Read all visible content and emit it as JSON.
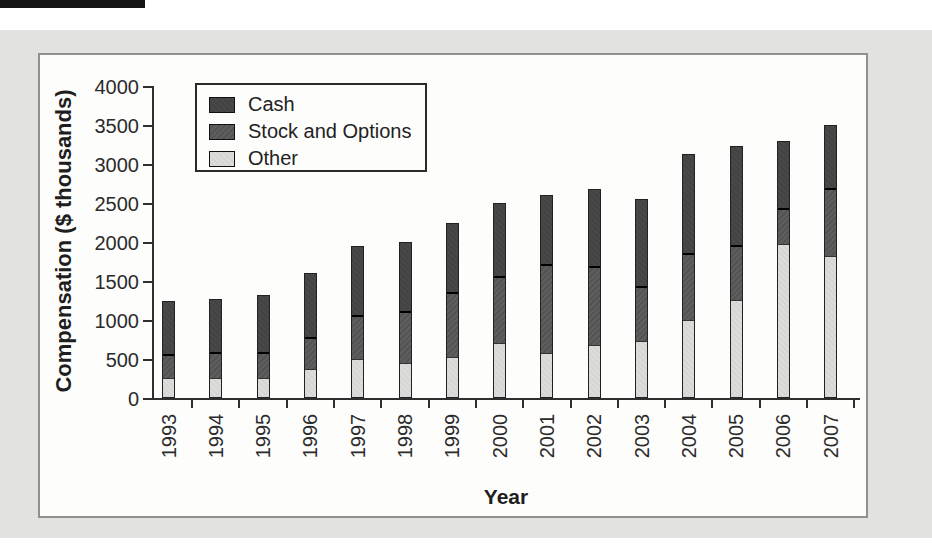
{
  "figure": {
    "kind": "printed textbook stacked bar chart",
    "colors": {
      "page_background": "#ffffff",
      "panel_background": "#e2e2df",
      "chart_background": "#fdfdfc",
      "frame_border": "#909090",
      "axis": "#2f2f2f",
      "bar_outline": "#222222",
      "segment_separator": "#000000"
    }
  },
  "chart_data": {
    "type": "bar",
    "stacked": true,
    "categories": [
      "1993",
      "1994",
      "1995",
      "1996",
      "1997",
      "1998",
      "1999",
      "2000",
      "2001",
      "2002",
      "2003",
      "2004",
      "2005",
      "2006",
      "2007"
    ],
    "series": [
      {
        "name": "Cash",
        "color": "#464646",
        "values": [
          700,
          700,
          750,
          825,
          900,
          900,
          900,
          950,
          900,
          1000,
          1125,
          1275,
          1275,
          875,
          825
        ]
      },
      {
        "name": "Stock and Options",
        "color": "#585858",
        "values": [
          300,
          325,
          325,
          400,
          550,
          650,
          825,
          850,
          1125,
          1000,
          700,
          850,
          700,
          450,
          850
        ]
      },
      {
        "name": "Other",
        "color": "#dbdbd9",
        "values": [
          250,
          250,
          250,
          375,
          500,
          450,
          525,
          700,
          575,
          675,
          725,
          1000,
          1250,
          1975,
          1825
        ]
      }
    ],
    "totals": [
      1250,
      1275,
      1325,
      1600,
      1950,
      2000,
      2250,
      2500,
      2600,
      2675,
      2550,
      3125,
      3225,
      3300,
      3500
    ],
    "stack_order_bottom_to_top": [
      "Other",
      "Stock and Options",
      "Cash"
    ],
    "xlabel": "Year",
    "ylabel": "Compensation ($ thousands)",
    "ylim": [
      0,
      4000
    ],
    "yticks": [
      "0",
      "500",
      "1000",
      "1500",
      "2000",
      "2500",
      "3000",
      "3500",
      "4000"
    ],
    "grid": "off",
    "legend_position": "upper left inside plot",
    "legend_entries": [
      "Cash",
      "Stock and Options",
      "Other"
    ]
  }
}
